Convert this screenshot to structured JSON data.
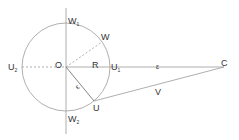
{
  "diagram": {
    "type": "geometry",
    "colors": {
      "stroke": "#9a9a9a",
      "dashed": "#9a9a9a",
      "text": "#333333"
    },
    "labels": {
      "W1": "W",
      "W1_sub": "1",
      "W": "W",
      "U2": "U",
      "U2_sub": "2",
      "O": "O",
      "R": "R",
      "U1": "U",
      "U1_sub": "1",
      "eps_oc": "ε",
      "C": "C",
      "eps_ou": "ε",
      "U": "U",
      "V": "V",
      "W2": "W",
      "W2_sub": "2"
    }
  }
}
